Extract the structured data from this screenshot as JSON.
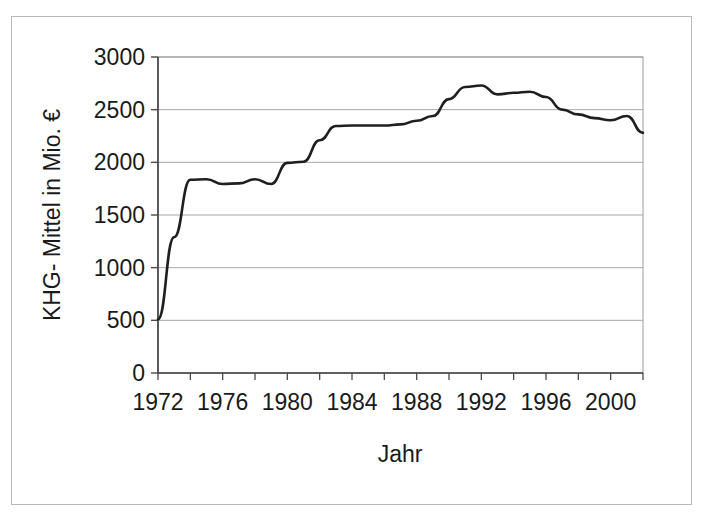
{
  "chart_data": {
    "type": "line",
    "title": "",
    "subtitle": "",
    "xlabel": "Jahr",
    "ylabel": "KHG- Mittel in Mio. €",
    "xlim": [
      1972,
      2002
    ],
    "ylim": [
      0,
      3000
    ],
    "grid": true,
    "grid_axis": "y",
    "legend": false,
    "legend_position": "none",
    "annotations": [],
    "y_ticks": [
      0,
      500,
      1000,
      1500,
      2000,
      2500,
      3000
    ],
    "y_tick_labels": [
      "0",
      "500",
      "1000",
      "1500",
      "2000",
      "2500",
      "3000"
    ],
    "x_ticks": [
      1972,
      1976,
      1980,
      1984,
      1988,
      1992,
      1996,
      2000
    ],
    "x_tick_labels": [
      "1972",
      "1976",
      "1980",
      "1984",
      "1988",
      "1992",
      "1996",
      "2000"
    ],
    "x_minor_ticks": [
      1972,
      1974,
      1976,
      1978,
      1980,
      1982,
      1984,
      1986,
      1988,
      1990,
      1992,
      1994,
      1996,
      1998,
      2000,
      2002
    ],
    "series": [
      {
        "name": "KHG- Mittel",
        "color": "#1f1f1f",
        "line_width": 2.6,
        "marker": "none",
        "x": [
          1972,
          1973,
          1974,
          1975,
          1976,
          1977,
          1978,
          1979,
          1980,
          1981,
          1982,
          1983,
          1984,
          1985,
          1986,
          1987,
          1988,
          1989,
          1990,
          1991,
          1992,
          1993,
          1994,
          1995,
          1996,
          1997,
          1998,
          1999,
          2000,
          2001,
          2002
        ],
        "values": [
          510,
          1290,
          1835,
          1840,
          1795,
          1800,
          1840,
          1795,
          1995,
          2005,
          2210,
          2345,
          2350,
          2350,
          2350,
          2360,
          2395,
          2440,
          2600,
          2715,
          2730,
          2645,
          2660,
          2670,
          2620,
          2500,
          2455,
          2420,
          2400,
          2440,
          2280
        ]
      }
    ]
  },
  "axes": {
    "y_label": "KHG- Mittel in Mio. €",
    "x_label": "Jahr"
  },
  "style": {
    "line_color": "#1f1f1f",
    "grid_color": "#a8a8aa",
    "axis_color": "#4a4a4a",
    "frame_color": "#b9b9bb",
    "background": "#ffffff",
    "text_color": "#1a1a1a"
  }
}
